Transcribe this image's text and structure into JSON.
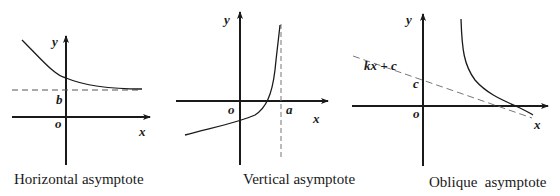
{
  "panels": [
    {
      "id": "horizontal",
      "caption": "Horizontal asymptote",
      "labels": {
        "y": "y",
        "x": "x",
        "origin": "o",
        "intercept": "b"
      }
    },
    {
      "id": "vertical",
      "caption": "Vertical asymptote",
      "labels": {
        "y": "y",
        "x": "x",
        "origin": "o",
        "intercept": "a"
      }
    },
    {
      "id": "oblique",
      "caption": "Oblique  asymptote",
      "labels": {
        "y": "y",
        "x": "x",
        "origin": "o",
        "intercept": "c",
        "line": "kx + c"
      }
    }
  ],
  "colors": {
    "ink": "#1a1a1a",
    "asymptote": "#555555",
    "background": "#ffffff"
  }
}
